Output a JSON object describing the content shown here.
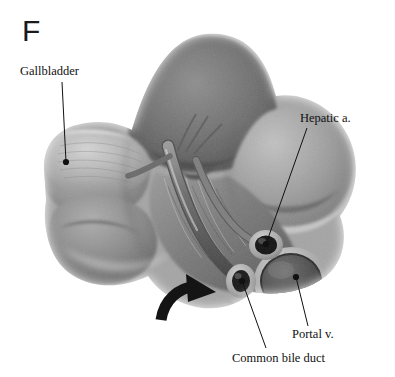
{
  "figure": {
    "panel_letter": "F",
    "background_color": "#ffffff",
    "ink_color": "#111111",
    "width": 395,
    "height": 377
  },
  "labels": {
    "gallbladder": "Gallbladder",
    "hepatic_artery": "Hepatic a.",
    "portal_vein": "Portal v.",
    "common_bile_duct": "Common bile duct"
  },
  "leader_lines": [
    {
      "name": "gallbladder-leader",
      "x1": 62,
      "y1": 82,
      "x2": 66,
      "y2": 162,
      "dot_at": "end"
    },
    {
      "name": "hepatic-artery-leader",
      "x1": 307,
      "y1": 128,
      "x2": 266,
      "y2": 244,
      "dot_at": "end"
    },
    {
      "name": "portal-vein-leader",
      "x1": 308,
      "y1": 326,
      "x2": 296,
      "y2": 277,
      "dot_at": "end"
    },
    {
      "name": "common-bile-duct-leader",
      "x1": 266,
      "y1": 348,
      "x2": 242,
      "y2": 281,
      "dot_at": "end"
    }
  ],
  "pointer_arrow": {
    "name": "probe-arrow",
    "color": "#141414",
    "description": "thick curved arrow sweeping up and to the right into the foramen"
  },
  "vessels": [
    {
      "name": "hepatic-artery-cross-section",
      "cx": 266,
      "cy": 245,
      "rx": 13,
      "ry": 11,
      "lumen_color": "#151515"
    },
    {
      "name": "common-bile-duct-cross-section",
      "cx": 241,
      "cy": 281,
      "rx": 11,
      "ry": 13,
      "lumen_color": "#1a1a1a"
    },
    {
      "name": "portal-vein-cross-section",
      "cx": 291,
      "cy": 281,
      "rx": 33,
      "ry": 30,
      "lumen_color": "#4a4a4a"
    }
  ]
}
